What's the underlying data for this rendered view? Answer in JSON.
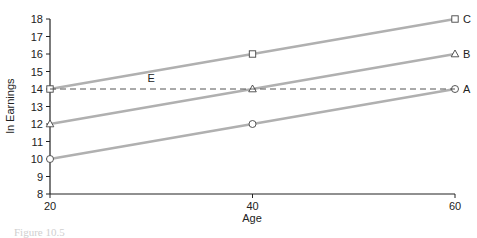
{
  "chart_data": {
    "type": "line",
    "title": "",
    "xlabel": "Age",
    "ylabel": "ln Earnings",
    "x": [
      20,
      40,
      60
    ],
    "xticks": [
      "20",
      "40",
      "60"
    ],
    "yticks": [
      "8",
      "9",
      "10",
      "11",
      "12",
      "13",
      "14",
      "15",
      "16",
      "17",
      "18"
    ],
    "xlim": [
      20,
      60
    ],
    "ylim": [
      8,
      18
    ],
    "grid": false,
    "legend": "inline labels at right end of lines",
    "series": [
      {
        "name": "A",
        "marker": "circle",
        "values": [
          10,
          12,
          14
        ],
        "style": "solid",
        "color": "#b0b0b0"
      },
      {
        "name": "B",
        "marker": "triangle",
        "values": [
          12,
          14,
          16
        ],
        "style": "solid",
        "color": "#b0b0b0"
      },
      {
        "name": "C",
        "marker": "square",
        "values": [
          14,
          16,
          18
        ],
        "style": "solid",
        "color": "#b0b0b0"
      },
      {
        "name": "E",
        "marker": "none",
        "values": [
          14,
          14,
          14
        ],
        "style": "dashed",
        "color": "#555555",
        "label_position": {
          "x": 30,
          "y": 14.4
        }
      }
    ]
  },
  "caption": "Figure 10.5"
}
